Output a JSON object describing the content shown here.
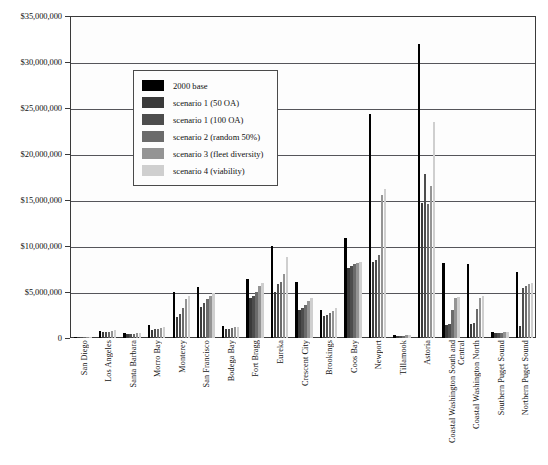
{
  "chart_data": {
    "type": "bar",
    "title": "",
    "xlabel": "",
    "ylabel": "",
    "ylim": [
      0,
      35000000
    ],
    "ytick_values": [
      0,
      5000000,
      10000000,
      15000000,
      20000000,
      25000000,
      30000000,
      35000000
    ],
    "ytick_labels": [
      "0",
      "$5,000,000",
      "$10,000,000",
      "$15,000,000",
      "$20,000,000",
      "$25,000,000",
      "$30,000,000",
      "$35,000,000"
    ],
    "grid": true,
    "legend_position": "upper-center-left",
    "categories": [
      "San Diego",
      "Los Angeles",
      "Santa Barbara",
      "Morro Bay",
      "Monterey",
      "San Francisco",
      "Bodega Bay",
      "Fort Bragg",
      "Eureka",
      "Crescent City",
      "Brookings",
      "Coos Bay",
      "Newport",
      "Tillamook",
      "Astoria",
      "Coastal Washington South and Central",
      "Coastal Washington North",
      "Southern Puget Sound",
      "Northern Puget Sound"
    ],
    "series": [
      {
        "name": "2000 base",
        "color": "#000000",
        "values": [
          150000,
          800000,
          550000,
          1400000,
          5000000,
          5500000,
          1300000,
          6400000,
          10000000,
          6100000,
          3000000,
          10900000,
          24300000,
          350000,
          32000000,
          8100000,
          8000000,
          700000,
          7200000
        ]
      },
      {
        "name": "scenario 1 (50 OA)",
        "color": "#3a3a3a",
        "values": [
          120000,
          600000,
          430000,
          900000,
          2300000,
          3400000,
          950000,
          4300000,
          5000000,
          3000000,
          2400000,
          7600000,
          8300000,
          230000,
          14700000,
          1400000,
          1500000,
          500000,
          1300000
        ]
      },
      {
        "name": "scenario 1 (100 OA)",
        "color": "#4d4d4d",
        "values": [
          130000,
          650000,
          450000,
          950000,
          2600000,
          3800000,
          1000000,
          4600000,
          5900000,
          3300000,
          2500000,
          7800000,
          8500000,
          250000,
          17800000,
          1500000,
          1600000,
          520000,
          5400000
        ]
      },
      {
        "name": "scenario 2 (random 50%)",
        "color": "#6b6b6b",
        "values": [
          130000,
          700000,
          470000,
          1000000,
          3300000,
          4200000,
          1050000,
          5000000,
          6100000,
          3600000,
          2700000,
          8000000,
          9000000,
          260000,
          14600000,
          3000000,
          3100000,
          540000,
          5600000
        ]
      },
      {
        "name": "scenario 3 (fleet diversity)",
        "color": "#949494",
        "values": [
          140000,
          760000,
          500000,
          1100000,
          4200000,
          4600000,
          1150000,
          5600000,
          7000000,
          4000000,
          2900000,
          8200000,
          15500000,
          300000,
          16500000,
          4300000,
          4400000,
          600000,
          5900000
        ]
      },
      {
        "name": "scenario 4 (viability)",
        "color": "#cfcfcf",
        "values": [
          145000,
          820000,
          520000,
          1250000,
          4600000,
          4900000,
          1200000,
          6000000,
          8800000,
          4300000,
          3300000,
          8300000,
          16200000,
          320000,
          23500000,
          4500000,
          4600000,
          650000,
          6000000
        ]
      }
    ]
  }
}
